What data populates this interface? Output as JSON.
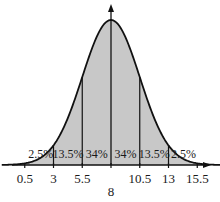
{
  "chart_data": {
    "type": "area",
    "title": "",
    "xlabel": "",
    "ylabel": "",
    "distribution": "normal",
    "mean": 8,
    "std_dev": 2.5,
    "x_ticks": [
      "0.5",
      "3",
      "5.5",
      "8",
      "10.5",
      "13",
      "15.5"
    ],
    "x_tick_values": [
      0.5,
      3,
      5.5,
      8,
      10.5,
      13,
      15.5
    ],
    "region_labels": [
      "2.5%",
      "13.5%",
      "34%",
      "34%",
      "13.5%",
      "2.5%"
    ],
    "regions": [
      {
        "from": 0.5,
        "to": 3,
        "percent": 2.5
      },
      {
        "from": 3,
        "to": 5.5,
        "percent": 13.5
      },
      {
        "from": 5.5,
        "to": 8,
        "percent": 34
      },
      {
        "from": 8,
        "to": 10.5,
        "percent": 34
      },
      {
        "from": 10.5,
        "to": 13,
        "percent": 13.5
      },
      {
        "from": 13,
        "to": 15.5,
        "percent": 2.5
      }
    ],
    "grid": false,
    "legend": "none",
    "fill_color": "#c8c8c8",
    "line_color": "#111111"
  }
}
